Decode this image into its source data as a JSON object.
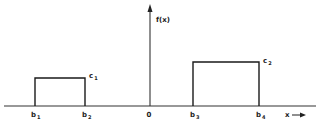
{
  "diagram": {
    "y_axis_label": "f(x)",
    "x_axis_label": "x",
    "origin_label": "0",
    "ticks": [
      {
        "base": "b",
        "sub": "1"
      },
      {
        "base": "b",
        "sub": "2"
      },
      {
        "base": "b",
        "sub": "3"
      },
      {
        "base": "b",
        "sub": "4"
      }
    ],
    "levels": [
      {
        "base": "c",
        "sub": "1"
      },
      {
        "base": "c",
        "sub": "2"
      }
    ],
    "rectangles": [
      {
        "from": "b1",
        "to": "b2",
        "height": "c1"
      },
      {
        "from": "b3",
        "to": "b4",
        "height": "c2"
      }
    ],
    "colors": {
      "ink": "#1a1a1a",
      "background": "#ffffff"
    }
  }
}
